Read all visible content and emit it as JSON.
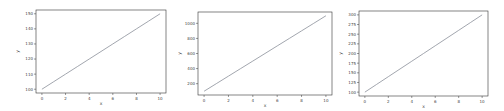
{
  "chart_data": [
    {
      "type": "line",
      "title": "",
      "xlabel": "x",
      "ylabel": "y",
      "x": [
        0,
        1,
        2,
        3,
        4,
        5,
        6,
        7,
        8,
        9,
        10
      ],
      "series": [
        {
          "name": "y",
          "values": [
            100,
            105,
            110,
            115,
            120,
            125,
            130,
            135,
            140,
            145,
            150
          ]
        }
      ],
      "xlim": [
        -0.5,
        10.5
      ],
      "ylim": [
        97.5,
        152.5
      ],
      "xticks": [
        0,
        2,
        4,
        6,
        8,
        10
      ],
      "yticks": [
        100,
        110,
        120,
        130,
        140,
        150
      ],
      "grid": false,
      "legend": null,
      "line_color": "#8a8f99"
    },
    {
      "type": "line",
      "title": "",
      "xlabel": "x",
      "ylabel": "y",
      "x": [
        0,
        1,
        2,
        3,
        4,
        5,
        6,
        7,
        8,
        9,
        10
      ],
      "series": [
        {
          "name": "y",
          "values": [
            100,
            200,
            300,
            400,
            500,
            600,
            700,
            800,
            900,
            1000,
            1100
          ]
        }
      ],
      "xlim": [
        -0.5,
        10.5
      ],
      "ylim": [
        50,
        1150
      ],
      "xticks": [
        0,
        2,
        4,
        6,
        8,
        10
      ],
      "yticks": [
        200,
        400,
        600,
        800,
        1000
      ],
      "grid": false,
      "legend": null,
      "line_color": "#8a8f99"
    },
    {
      "type": "line",
      "title": "",
      "xlabel": "x",
      "ylabel": "y",
      "x": [
        0,
        1,
        2,
        3,
        4,
        5,
        6,
        7,
        8,
        9,
        10
      ],
      "series": [
        {
          "name": "y",
          "values": [
            100,
            120,
            140,
            160,
            180,
            200,
            220,
            240,
            260,
            280,
            300
          ]
        }
      ],
      "xlim": [
        -0.5,
        10.5
      ],
      "ylim": [
        90,
        310
      ],
      "xticks": [
        0,
        2,
        4,
        6,
        8,
        10
      ],
      "yticks": [
        100,
        125,
        150,
        175,
        200,
        225,
        250,
        275,
        300
      ],
      "grid": false,
      "legend": null,
      "line_color": "#8a8f99"
    }
  ],
  "layout": [
    {
      "left": 0,
      "width": 168,
      "plot": {
        "x0": 36,
        "y0": 10,
        "x1": 166,
        "y1": 93
      }
    },
    {
      "left": 168,
      "width": 168,
      "plot": {
        "x0": 30,
        "y0": 12,
        "x1": 164,
        "y1": 95
      }
    },
    {
      "left": 336,
      "width": 168,
      "plot": {
        "x0": 23,
        "y0": 11,
        "x1": 152,
        "y1": 96
      }
    }
  ]
}
